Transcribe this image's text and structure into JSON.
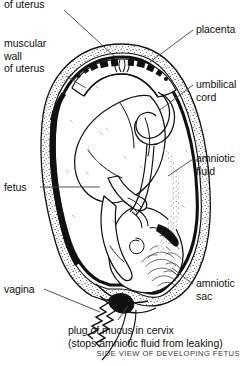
{
  "diagram": {
    "title": "SIDE VIEW OF DEVELOPING FETUS",
    "labels": {
      "top_uterus": "of uterus",
      "muscular_wall": "muscular\nwall\nof uterus",
      "fetus": "fetus",
      "vagina": "vagina",
      "placenta": "placenta",
      "umbilical_cord": "umbilical\ncord",
      "amniotic_fluid": "amniotic\nfluid",
      "amniotic_sac": "amniotic\nsac",
      "mucus_plug": "plug of mucus in cervix\n(stops amniotic fluid from leaking)"
    },
    "colors": {
      "ink": "#111111",
      "background": "#ffffff",
      "caption": "#3a3a3a",
      "leader_line": "#4a4a4a",
      "sac_dark": "#111111",
      "wall_stipple": "#6b6b6b"
    }
  }
}
